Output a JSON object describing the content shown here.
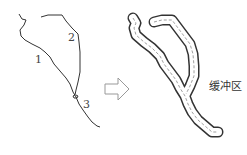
{
  "diagram": {
    "source_labels": [
      "1",
      "2",
      "3"
    ],
    "result_label": "缓冲区",
    "arrow": "hollow-right-arrow",
    "colors": {
      "line": "#333333",
      "arrow": "#999999",
      "buffer_outline": "#333333",
      "buffer_fill": "#ffffff"
    }
  }
}
